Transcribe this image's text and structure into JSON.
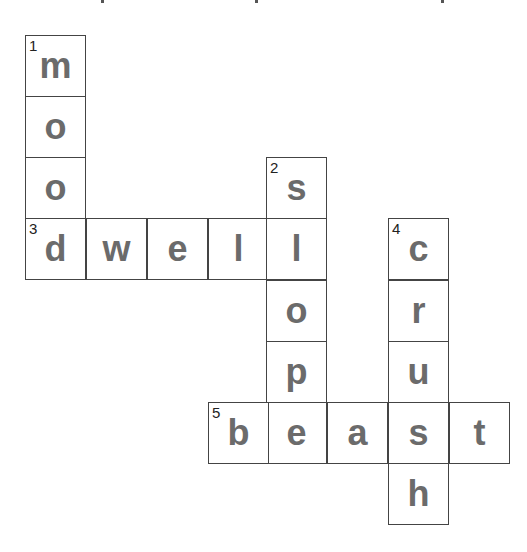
{
  "puzzle": {
    "type": "crossword",
    "cell_size": 61,
    "origin": {
      "x": 25,
      "y": 35
    },
    "columns_x": [
      25,
      86,
      147,
      208,
      266,
      327,
      388,
      449
    ],
    "rows_y": [
      35,
      96,
      157,
      218,
      280,
      341,
      402,
      463
    ],
    "cells": [
      {
        "col": 0,
        "row": 0,
        "letter": "m",
        "number": "1"
      },
      {
        "col": 0,
        "row": 1,
        "letter": "o",
        "number": ""
      },
      {
        "col": 0,
        "row": 2,
        "letter": "o",
        "number": ""
      },
      {
        "col": 0,
        "row": 3,
        "letter": "d",
        "number": "3"
      },
      {
        "col": 1,
        "row": 3,
        "letter": "w",
        "number": ""
      },
      {
        "col": 2,
        "row": 3,
        "letter": "e",
        "number": ""
      },
      {
        "col": 3,
        "row": 3,
        "letter": "l",
        "number": ""
      },
      {
        "col": 4,
        "row": 2,
        "letter": "s",
        "number": "2"
      },
      {
        "col": 4,
        "row": 3,
        "letter": "l",
        "number": ""
      },
      {
        "col": 4,
        "row": 4,
        "letter": "o",
        "number": ""
      },
      {
        "col": 4,
        "row": 5,
        "letter": "p",
        "number": ""
      },
      {
        "col": 4,
        "row": 6,
        "letter": "e",
        "number": ""
      },
      {
        "col": 3,
        "row": 6,
        "letter": "b",
        "number": "5"
      },
      {
        "col": 5,
        "row": 6,
        "letter": "a",
        "number": ""
      },
      {
        "col": 6,
        "row": 6,
        "letter": "s",
        "number": ""
      },
      {
        "col": 7,
        "row": 6,
        "letter": "t",
        "number": ""
      },
      {
        "col": 6,
        "row": 3,
        "letter": "c",
        "number": "4"
      },
      {
        "col": 6,
        "row": 4,
        "letter": "r",
        "number": ""
      },
      {
        "col": 6,
        "row": 5,
        "letter": "u",
        "number": ""
      },
      {
        "col": 6,
        "row": 7,
        "letter": "h",
        "number": ""
      }
    ],
    "words": {
      "down": [
        {
          "number": "1",
          "answer": "mood"
        },
        {
          "number": "2",
          "answer": "slope"
        },
        {
          "number": "4",
          "answer": "crush"
        }
      ],
      "across": [
        {
          "number": "3",
          "answer": "dwell"
        },
        {
          "number": "5",
          "answer": "beast"
        }
      ]
    }
  },
  "colors": {
    "letter": "#6b6b6b",
    "border": "#444444",
    "number": "#222222"
  }
}
